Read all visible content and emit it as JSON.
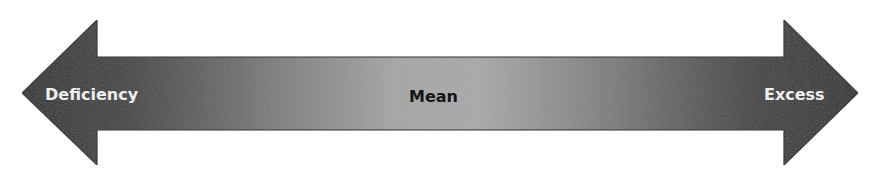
{
  "diagram": {
    "type": "double-headed-arrow-spectrum",
    "labels": {
      "left": "Deficiency",
      "center": "Mean",
      "right": "Excess"
    },
    "colors": {
      "ends": "#2a2a2a",
      "center": "#a9a9a9",
      "outline": "#1a1a1a",
      "end_text": "#eeeeee",
      "center_text": "#151515",
      "background": "#ffffff"
    }
  }
}
